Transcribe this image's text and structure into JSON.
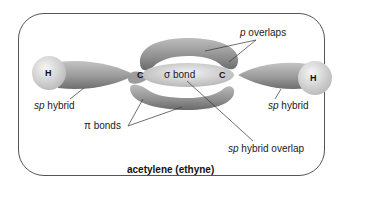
{
  "diagram": {
    "title": "acetylene (ethyne)",
    "atoms": [
      {
        "id": "H-left",
        "symbol": "H"
      },
      {
        "id": "C-left",
        "symbol": "C"
      },
      {
        "id": "C-right",
        "symbol": "C"
      },
      {
        "id": "H-right",
        "symbol": "H"
      }
    ],
    "labels": {
      "p_overlaps": {
        "italic": "p",
        "text": " overlaps"
      },
      "sigma_bond": "σ bond",
      "sp_hybrid_left": {
        "italic": "sp",
        "text": " hybrid"
      },
      "sp_hybrid_right": {
        "italic": "sp",
        "text": " hybrid"
      },
      "pi_bonds": "π bonds",
      "sp_hybrid_overlap": {
        "italic": "sp",
        "text": " hybrid overlap"
      }
    },
    "colors": {
      "orbital_fill": "#a8a8a8",
      "orbital_dark": "#7a7a7a",
      "hydrogen_fill": "#dcdcdc",
      "frame": "#555555"
    }
  }
}
